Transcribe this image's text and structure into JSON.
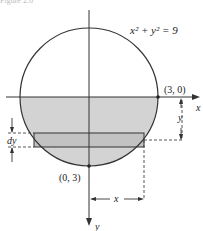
{
  "figure": {
    "caption": "Figure 2.6",
    "equation": "x² + y² = 9",
    "labels": {
      "point_right": "(3, 0)",
      "point_bottom": "(0, 3)",
      "x_axis": "x",
      "y_axis": "y",
      "dy": "dy",
      "y_dimension": "y",
      "x_dimension": "x"
    },
    "colors": {
      "shade": "#d3d3d3",
      "strip": "#c2c2c2",
      "stroke": "#333333"
    }
  }
}
